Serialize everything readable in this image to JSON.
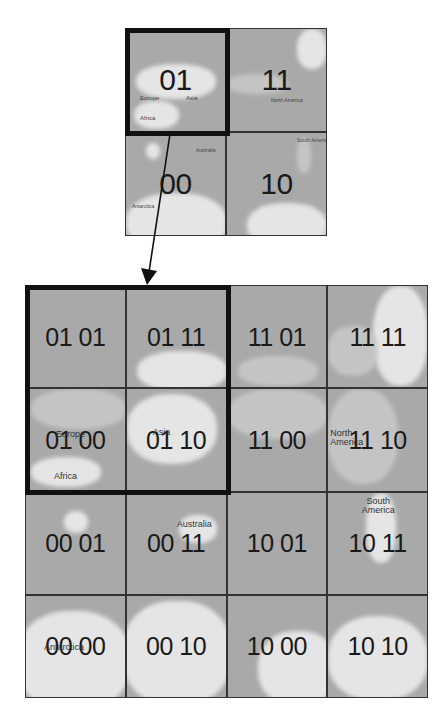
{
  "diagram": {
    "type": "quadtree-tile-zoom",
    "colors": {
      "ocean": "#a9a9a9",
      "land": "#ececec",
      "grid_line": "#333333",
      "highlight_border": "#111111",
      "arrow": "#111111"
    },
    "top_grid": {
      "level": 1,
      "tiles": [
        {
          "code": "01",
          "row": 0,
          "col": 0,
          "highlighted": true
        },
        {
          "code": "11",
          "row": 0,
          "col": 1
        },
        {
          "code": "00",
          "row": 1,
          "col": 0
        },
        {
          "code": "10",
          "row": 1,
          "col": 1
        }
      ],
      "map_labels": [
        "Europe",
        "Asia",
        "Africa",
        "Australia",
        "North America",
        "South America",
        "Antarctica"
      ]
    },
    "arrow": {
      "from": "top_grid.tile_01",
      "to": "bottom_grid.highlight"
    },
    "bottom_grid": {
      "level": 2,
      "rows": [
        [
          "01 01",
          "01 11",
          "11 01",
          "11 11"
        ],
        [
          "01 00",
          "01 10",
          "11 00",
          "11 10"
        ],
        [
          "00 01",
          "00 11",
          "10 01",
          "10 11"
        ],
        [
          "00 00",
          "00 10",
          "10 00",
          "10 10"
        ]
      ],
      "highlight": {
        "rows": [
          0,
          1
        ],
        "cols": [
          0,
          1
        ],
        "parent_code": "01"
      },
      "map_labels": {
        "europe": "Europe",
        "africa": "Africa",
        "asia": "Asia",
        "north_america": "North America",
        "south_america": "South America",
        "australia": "Australia",
        "antarctica": "Antarctica"
      }
    }
  }
}
